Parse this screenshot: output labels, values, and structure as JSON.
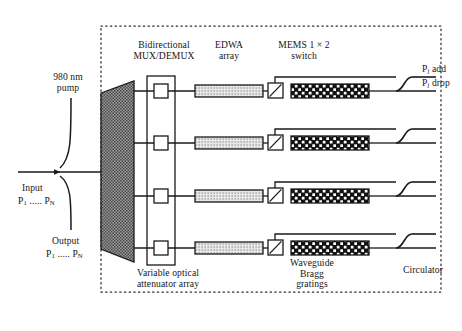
{
  "figure": {
    "type": "optical-network-block-diagram",
    "dashed_boundary": true,
    "channel_count": 4
  },
  "labels": {
    "pump": "980 nm\npump",
    "mux_demux": "Bidirectional\nMUX/DEMUX",
    "edwa": "EDWA\narray",
    "mems": "MEMS 1 × 2\nswitch",
    "voa": "Variable optical\nattenuator array",
    "bragg": "Waveguide\nBragg\ngratings",
    "circulator": "Circulator",
    "input": "Input",
    "input_ports": "P<sub>1</sub> ..... P<sub>N</sub>",
    "output": "Output",
    "output_ports": "P<sub>1</sub> ..... P<sub>N</sub>",
    "add_port": "P<sub>j</sub> add",
    "drop_port": "P<sub>j</sub> drop"
  },
  "components": {
    "mux_demux": {
      "name": "Bidirectional MUX/DEMUX",
      "shape": "trapezoid",
      "fill": "cross-hatch-dark"
    },
    "voa_array": {
      "name": "Variable optical attenuator array",
      "shape": "tall-rectangle",
      "cells": 4
    },
    "edwa_array": {
      "name": "EDWA array",
      "shape": "rectangle",
      "fill": "light-dotted",
      "count": 4
    },
    "mems_switch": {
      "name": "MEMS 1 x 2 switch",
      "shape": "small-square-with-diagonal",
      "count": 4
    },
    "bragg_gratings": {
      "name": "Waveguide Bragg gratings",
      "shape": "rectangle",
      "fill": "dark-checker",
      "count": 4
    },
    "circulators": {
      "name": "Circulator",
      "shape": "s-curve",
      "count": 4
    }
  },
  "colors": {
    "line": "#1a1a1a",
    "dark_fill": "#6e6e6e",
    "light_fill": "#d8d8d8",
    "grating_fill": "#1c1c1c",
    "background": "#ffffff",
    "dashed": "#2a2a2a"
  }
}
